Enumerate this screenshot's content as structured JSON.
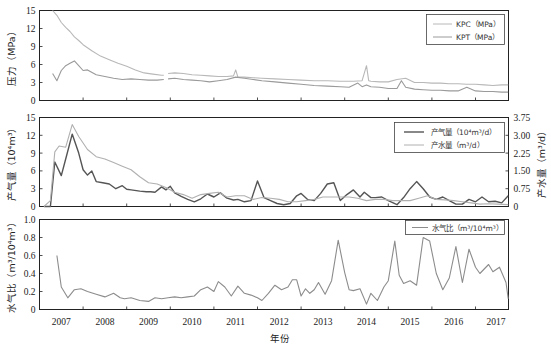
{
  "xlabel": "年份",
  "caption": "图 … 生产曲线图",
  "x_ticks": [
    "2007",
    "2008",
    "2009",
    "2010",
    "2011",
    "2012",
    "2013",
    "2014",
    "2015",
    "2016",
    "2017"
  ],
  "colors": {
    "light": "#b4b4b4",
    "mid": "#a0a0a0",
    "dark": "#555555",
    "axis": "#222222"
  },
  "chart_data": [
    {
      "type": "line",
      "title": "",
      "ylabel": "压力（MPa）",
      "ylim": [
        0,
        15
      ],
      "yticks": [
        "0",
        "3",
        "6",
        "9",
        "12",
        "15"
      ],
      "xlabel": "",
      "xlim": [
        2007.0,
        2017.75
      ],
      "legend_position": "upper right",
      "series": [
        {
          "name": "KPC（MPa）",
          "color": "#b8b8b8",
          "x": [
            2007.3,
            2007.4,
            2007.5,
            2007.6,
            2007.7,
            2007.8,
            2007.9,
            2008.0,
            2008.2,
            2008.4,
            2008.6,
            2008.8,
            2009.0,
            2009.2,
            2009.4,
            2009.6,
            2009.8,
            2009.85,
            null,
            2009.95,
            2010.1,
            2010.3,
            2010.5,
            2010.7,
            2010.9,
            2011.1,
            2011.3,
            2011.45,
            2011.5,
            2011.55,
            2011.7,
            2011.9,
            2012.1,
            2012.4,
            2012.7,
            2013.0,
            2013.3,
            2013.6,
            2013.9,
            2014.2,
            2014.4,
            2014.5,
            2014.55,
            2014.6,
            2014.8,
            2015.0,
            2015.2,
            2015.4,
            2015.6,
            2015.8,
            2016.0,
            2016.2,
            2016.4,
            2016.6,
            2016.8,
            2017.0,
            2017.2,
            2017.4,
            2017.6,
            2017.75
          ],
          "y": [
            15,
            14.2,
            13,
            12.2,
            11.5,
            10.6,
            10,
            9.3,
            8.3,
            7.4,
            6.8,
            6.2,
            5.7,
            5.1,
            4.6,
            4.4,
            4.2,
            4.2,
            null,
            4.5,
            4.6,
            4.5,
            4.3,
            4.2,
            4.1,
            4.0,
            4.0,
            4.1,
            5.1,
            3.9,
            3.9,
            3.8,
            3.7,
            3.6,
            3.5,
            3.4,
            3.3,
            3.3,
            3.2,
            3.2,
            3.3,
            5.8,
            3.3,
            3.2,
            3.1,
            3.1,
            3.5,
            3.7,
            3.0,
            3.0,
            2.9,
            2.9,
            2.8,
            2.8,
            2.7,
            2.7,
            2.6,
            2.5,
            2.6,
            2.6
          ]
        },
        {
          "name": "KPT（MPa）",
          "color": "#9a9a9a",
          "x": [
            2007.3,
            2007.4,
            2007.5,
            2007.6,
            2007.7,
            2007.8,
            2007.9,
            2008.0,
            2008.1,
            2008.3,
            2008.5,
            2008.7,
            2008.9,
            2009.1,
            2009.3,
            2009.5,
            2009.7,
            2009.85,
            null,
            2009.95,
            2010.1,
            2010.3,
            2010.5,
            2010.7,
            2010.9,
            2011.1,
            2011.3,
            2011.5,
            2011.7,
            2011.9,
            2012.1,
            2012.4,
            2012.7,
            2013.0,
            2013.3,
            2013.6,
            2013.9,
            2014.1,
            2014.3,
            2014.4,
            2014.5,
            2014.6,
            2014.8,
            2015.0,
            2015.2,
            2015.3,
            2015.4,
            2015.6,
            2015.8,
            2016.0,
            2016.2,
            2016.4,
            2016.6,
            2016.8,
            2017.0,
            2017.2,
            2017.4,
            2017.6,
            2017.75
          ],
          "y": [
            4.5,
            3.3,
            5.0,
            5.8,
            6.2,
            6.6,
            5.8,
            5.0,
            5.1,
            4.3,
            4.0,
            3.7,
            3.5,
            3.6,
            3.5,
            3.4,
            3.4,
            3.5,
            null,
            3.6,
            3.7,
            3.5,
            3.4,
            3.3,
            3.1,
            3.3,
            3.5,
            3.9,
            3.7,
            3.5,
            3.3,
            3.1,
            2.9,
            2.7,
            2.5,
            2.4,
            2.3,
            2.2,
            2.9,
            2.3,
            2.6,
            2.3,
            2.2,
            2.0,
            2.0,
            3.3,
            2.2,
            1.9,
            1.8,
            1.7,
            1.7,
            1.6,
            1.6,
            2.2,
            1.6,
            1.5,
            1.5,
            1.4,
            1.4
          ]
        }
      ]
    },
    {
      "type": "line",
      "title": "",
      "ylabel": "产气量（10⁴m³）",
      "ylabel_right": "产水量（m³/d）",
      "ylim": [
        0,
        15
      ],
      "yticks": [
        "0",
        "3",
        "6",
        "9",
        "12",
        "15"
      ],
      "ylim_right": [
        0,
        3.75
      ],
      "yticks_right": [
        "0",
        "0.75",
        "1.50",
        "2.25",
        "3.00",
        "3.75"
      ],
      "xlim": [
        2007.0,
        2017.75
      ],
      "legend_position": "upper right",
      "series": [
        {
          "name": "产气量（10⁴m³/d）",
          "color": "#555555",
          "axis": "left",
          "x": [
            2007.1,
            2007.25,
            2007.35,
            2007.5,
            2007.6,
            2007.75,
            2007.9,
            2008.0,
            2008.1,
            2008.2,
            2008.3,
            2008.45,
            2008.6,
            2008.75,
            2008.9,
            2009.0,
            2009.1,
            2009.3,
            2009.45,
            2009.55,
            2009.65,
            2009.8,
            2009.9,
            2010.0,
            2010.1,
            2010.25,
            2010.4,
            2010.55,
            2010.7,
            2010.85,
            2011.0,
            2011.15,
            2011.3,
            2011.45,
            2011.55,
            2011.7,
            2011.85,
            2012.0,
            2012.15,
            2012.3,
            2012.45,
            2012.6,
            2012.75,
            2012.9,
            2013.0,
            2013.15,
            2013.3,
            2013.45,
            2013.6,
            2013.75,
            2013.9,
            2014.05,
            2014.2,
            2014.35,
            2014.45,
            2014.6,
            2014.7,
            2014.85,
            2015.0,
            2015.2,
            2015.35,
            2015.5,
            2015.65,
            2015.8,
            2015.95,
            2016.1,
            2016.25,
            2016.4,
            2016.55,
            2016.7,
            2016.85,
            2017.0,
            2017.15,
            2017.3,
            2017.45,
            2017.6,
            2017.75
          ],
          "y": [
            0,
            0,
            7.5,
            5.2,
            8,
            12.2,
            9,
            6.2,
            5.3,
            6,
            4.2,
            4,
            3.8,
            3,
            3.5,
            2.9,
            2.8,
            2.6,
            2.5,
            2.5,
            2.4,
            3.3,
            2.8,
            3.4,
            2.3,
            1.7,
            1.2,
            0.8,
            1.3,
            2.1,
            1.6,
            2.3,
            1.4,
            1.1,
            1.2,
            0.8,
            1.0,
            4.3,
            1.5,
            1.0,
            0.5,
            0.3,
            0.5,
            1.8,
            2.2,
            1.2,
            1.0,
            2.2,
            3.8,
            4.0,
            1.0,
            2.0,
            2.8,
            1.6,
            2.4,
            1.5,
            1.5,
            1.6,
            1.0,
            0.3,
            1.5,
            3.0,
            4.2,
            3.0,
            1.6,
            1.2,
            1.6,
            1.0,
            0.4,
            0.4,
            1.2,
            0.8,
            1.6,
            0.8,
            0.9,
            0.6,
            1.8
          ]
        },
        {
          "name": "产水量（m³/d）",
          "color": "#b0b0b0",
          "axis": "right",
          "x": [
            2007.1,
            2007.25,
            2007.35,
            2007.45,
            2007.6,
            2007.75,
            2007.9,
            2008.1,
            2008.3,
            2008.5,
            2008.7,
            2008.9,
            2009.1,
            2009.3,
            2009.5,
            2009.7,
            2009.9,
            2010.1,
            2010.3,
            2010.5,
            2010.7,
            2010.9,
            2011.1,
            2011.3,
            2011.5,
            2011.7,
            2011.9,
            2012.1,
            2012.3,
            2012.5,
            2012.7,
            2012.9,
            2013.1,
            2013.3,
            2013.5,
            2013.7,
            2013.9,
            2014.1,
            2014.3,
            2014.5,
            2014.7,
            2014.9,
            2015.1,
            2015.3,
            2015.5,
            2015.7,
            2015.9,
            2016.1,
            2016.3,
            2016.5,
            2016.7,
            2016.9,
            2017.1,
            2017.3,
            2017.5,
            2017.75
          ],
          "y": [
            0,
            0.25,
            2.3,
            2.55,
            2.5,
            3.45,
            2.95,
            2.4,
            2.1,
            2.0,
            1.85,
            1.7,
            1.55,
            1.25,
            1.0,
            0.95,
            0.8,
            0.6,
            0.5,
            0.35,
            0.5,
            0.55,
            0.6,
            0.4,
            0.45,
            0.45,
            0.3,
            0.38,
            0.35,
            0.3,
            0.2,
            0.2,
            0.25,
            0.3,
            0.4,
            0.4,
            0.4,
            0.4,
            0.35,
            0.25,
            0.3,
            0.3,
            0.25,
            0.25,
            0.25,
            0.35,
            0.45,
            0.3,
            0.28,
            0.25,
            0.2,
            0.15,
            0.1,
            0.12,
            0.1,
            0.08
          ]
        }
      ]
    },
    {
      "type": "line",
      "title": "",
      "ylabel": "水气比（m³/10⁴m³）",
      "ylim": [
        0,
        1.0
      ],
      "yticks": [
        "0",
        "0.2",
        "0.4",
        "0.6",
        "0.8",
        "1.0"
      ],
      "xlabel": "年份",
      "xlim": [
        2007.0,
        2017.75
      ],
      "legend_position": "upper right",
      "series": [
        {
          "name": "水气比（m³/10⁴m³）",
          "color": "#8c8c8c",
          "x": [
            2007.4,
            2007.5,
            2007.65,
            2007.8,
            2007.95,
            2008.1,
            2008.3,
            2008.5,
            2008.7,
            2008.85,
            2008.95,
            2009.1,
            2009.3,
            2009.5,
            2009.65,
            2009.8,
            2009.95,
            2010.1,
            2010.25,
            2010.4,
            2010.55,
            2010.7,
            2010.85,
            2011.0,
            2011.1,
            2011.25,
            2011.4,
            2011.55,
            2011.7,
            2011.85,
            2012.0,
            2012.1,
            2012.25,
            2012.4,
            2012.55,
            2012.7,
            2012.8,
            2012.9,
            2013.0,
            2013.1,
            2013.2,
            2013.3,
            2013.4,
            2013.55,
            2013.7,
            2013.85,
            2014.0,
            2014.1,
            2014.2,
            2014.35,
            2014.5,
            2014.6,
            2014.75,
            2014.9,
            2015.0,
            2015.15,
            2015.25,
            2015.35,
            2015.5,
            2015.65,
            2015.8,
            2015.95,
            2016.1,
            2016.25,
            2016.4,
            2016.55,
            2016.7,
            2016.85,
            2017.0,
            2017.1,
            2017.2,
            2017.3,
            2017.4,
            2017.55,
            2017.7,
            2017.75
          ],
          "y": [
            0.6,
            0.25,
            0.13,
            0.22,
            0.23,
            0.2,
            0.17,
            0.14,
            0.18,
            0.13,
            0.12,
            0.13,
            0.1,
            0.09,
            0.13,
            0.12,
            0.13,
            0.14,
            0.13,
            0.14,
            0.15,
            0.22,
            0.25,
            0.2,
            0.31,
            0.25,
            0.15,
            0.26,
            0.18,
            0.16,
            0.13,
            0.1,
            0.18,
            0.27,
            0.22,
            0.25,
            0.33,
            0.33,
            0.15,
            0.23,
            0.18,
            0.22,
            0.3,
            0.17,
            0.32,
            0.77,
            0.41,
            0.22,
            0.21,
            0.23,
            0.06,
            0.18,
            0.1,
            0.25,
            0.32,
            0.76,
            0.38,
            0.29,
            0.32,
            0.27,
            0.8,
            0.76,
            0.4,
            0.22,
            0.35,
            0.7,
            0.3,
            0.67,
            0.47,
            0.4,
            0.45,
            0.5,
            0.42,
            0.47,
            0.3,
            0.12
          ]
        }
      ]
    }
  ]
}
